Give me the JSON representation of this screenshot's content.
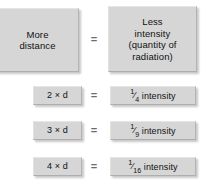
{
  "diagram": {
    "colors": {
      "box_fill": "#d6d6d6",
      "background": "#ffffff",
      "text": "#111111",
      "equals": "#6c6c6c"
    },
    "header": {
      "left_label": "More\ndistance",
      "left_line1": "More",
      "left_line2": "distance",
      "equals": "=",
      "right_line1": "Less",
      "right_line2": "intensity",
      "right_line3": "(quantity of",
      "right_line4": "radiation)"
    },
    "rows": [
      {
        "distance": "2 × d",
        "equals": "=",
        "intensity_numerator": "1",
        "intensity_slash": "⁄",
        "intensity_denominator": "4",
        "intensity_unit": "intensity",
        "intensity_full": "¼ intensity"
      },
      {
        "distance": "3 × d",
        "equals": "=",
        "intensity_numerator": "1",
        "intensity_slash": "⁄",
        "intensity_denominator": "9",
        "intensity_unit": "intensity",
        "intensity_full": "⅙ intensity"
      },
      {
        "distance": "4 × d",
        "equals": "=",
        "intensity_numerator": "1",
        "intensity_slash": "⁄",
        "intensity_denominator": "16",
        "intensity_unit": "intensity",
        "intensity_full": "1⁄16 intensity"
      }
    ]
  }
}
